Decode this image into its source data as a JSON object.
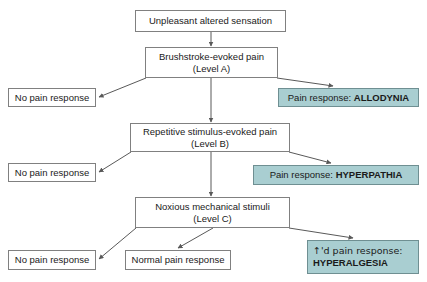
{
  "diagram": {
    "title_node": "Unpleasant altered sensation",
    "colors": {
      "teal_fill": "#a9ced1",
      "teal_border": "#6f8f92",
      "box_border": "#808080",
      "edge_stroke": "#595959",
      "background": "#ffffff",
      "text": "#1a1a1a"
    },
    "nodes": {
      "root": {
        "label": "Unpleasant altered sensation"
      },
      "level_a": {
        "line1": "Brushstroke-evoked pain",
        "line2": "(Level A)"
      },
      "level_a_no_pain": {
        "label": "No pain response"
      },
      "allodynia": {
        "lead": "Pain response: ",
        "term": "ALLODYNIA"
      },
      "level_b": {
        "line1": "Repetitive stimulus-evoked pain",
        "line2": "(Level B)"
      },
      "level_b_no_pain": {
        "label": "No pain response"
      },
      "hyperpathia": {
        "lead": "Pain response: ",
        "term": "HYPERPATHIA"
      },
      "level_c": {
        "line1": "Noxious mechanical stimuli",
        "line2": "(Level C)"
      },
      "level_c_no_pain": {
        "label": "No pain response"
      },
      "level_c_normal_pain": {
        "label": "Normal pain response"
      },
      "hyperalgesia": {
        "lead": "↑'d pain response:",
        "term": "HYPERALGESIA"
      }
    }
  }
}
